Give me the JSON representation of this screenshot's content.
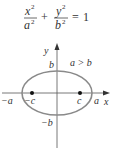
{
  "equation": {
    "term1_num": "x",
    "term1_num_exp": "2",
    "term1_den": "a",
    "term1_den_exp": "2",
    "plus": "+",
    "term2_num": "y",
    "term2_num_exp": "2",
    "term2_den": "b",
    "term2_den_exp": "2",
    "equals": "=",
    "rhs": "1"
  },
  "diagram": {
    "axis_x_label": "x",
    "axis_y_label": "y",
    "label_b": "b",
    "label_neg_b": "−b",
    "label_a": "a",
    "label_neg_a": "−a",
    "label_c": "c",
    "label_neg_c": "−c",
    "condition": "a > b",
    "ellipse_color": "#8a8a8a",
    "axis_color": "#555555",
    "text_color": "#333333"
  }
}
